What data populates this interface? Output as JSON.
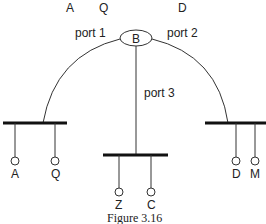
{
  "top_labels": [
    "A",
    "Q",
    "D"
  ],
  "bridge": {
    "label": "B"
  },
  "ports": {
    "port1": "port 1",
    "port2": "port 2",
    "port3": "port 3"
  },
  "segments": {
    "left": {
      "stations": [
        "A",
        "Q"
      ]
    },
    "middle": {
      "stations": [
        "Z",
        "C"
      ]
    },
    "right": {
      "stations": [
        "D",
        "M"
      ]
    }
  },
  "caption": "Figure 3.16",
  "colors": {
    "line": "#333333",
    "bus": "#111111",
    "text": "#222222"
  }
}
